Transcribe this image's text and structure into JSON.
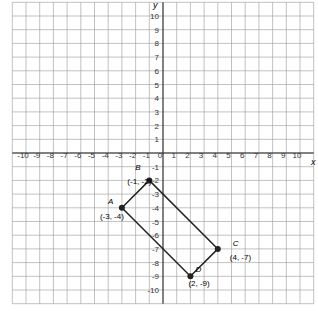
{
  "chart_data": {
    "type": "scatter",
    "title": "",
    "xlabel": "x",
    "ylabel": "y",
    "xlim": [
      -11,
      11
    ],
    "ylim": [
      -11,
      11
    ],
    "grid": true,
    "x_ticks": [
      -10,
      -9,
      -8,
      -7,
      -6,
      -5,
      -4,
      -3,
      -2,
      -1,
      0,
      1,
      2,
      3,
      4,
      5,
      6,
      7,
      8,
      9,
      10
    ],
    "y_ticks": [
      10,
      9,
      8,
      7,
      6,
      5,
      4,
      3,
      2,
      1,
      -1,
      -2,
      -3,
      -4,
      -5,
      -6,
      -7,
      -8,
      -9,
      -10
    ],
    "points": [
      {
        "name": "A",
        "label": "(-3, -4)",
        "x": -3,
        "y": -4
      },
      {
        "name": "B",
        "label": "(-1, -2)",
        "x": -1,
        "y": -2
      },
      {
        "name": "C",
        "label": "(4, -7)",
        "x": 4,
        "y": -7
      },
      {
        "name": "D",
        "label": "(2, -9)",
        "x": 2,
        "y": -9
      }
    ],
    "polygon": [
      "A",
      "B",
      "C",
      "D"
    ]
  }
}
